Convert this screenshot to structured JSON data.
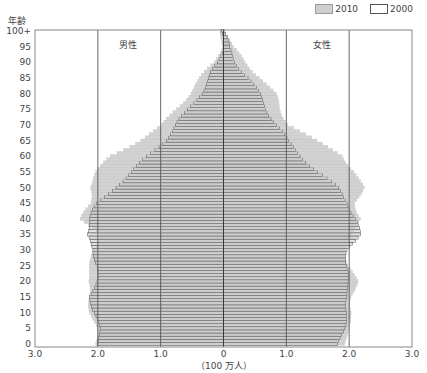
{
  "chart_data": {
    "type": "bar",
    "subtype": "population-pyramid",
    "title": "",
    "ylabel": "年齢",
    "xlabel": "（100 万人）",
    "x_unit": "100 万人",
    "xlim": [
      -3.0,
      3.0
    ],
    "x_ticks": [
      "3.0",
      "2.0",
      "1.0",
      "0",
      "1.0",
      "2.0",
      "3.0"
    ],
    "y_ticks": [
      "0",
      "5",
      "10",
      "15",
      "20",
      "25",
      "30",
      "35",
      "40",
      "45",
      "50",
      "55",
      "60",
      "65",
      "70",
      "75",
      "80",
      "85",
      "90",
      "95",
      "100+"
    ],
    "ylim": [
      0,
      100
    ],
    "grid": "vertical lines at ±1.0 and ±2.0 and 0",
    "legend": [
      {
        "label": "2010",
        "fill": "#cfcfcf",
        "stroke": "#9a9a9a"
      },
      {
        "label": "2000",
        "fill": "#ffffff",
        "stroke": "#555555"
      }
    ],
    "legend_position": "top-right",
    "annotations": {
      "male_label": "男性",
      "female_label": "女性"
    },
    "age_groups_step": 5,
    "ages": [
      0,
      5,
      10,
      15,
      20,
      25,
      30,
      35,
      40,
      45,
      50,
      55,
      60,
      65,
      70,
      75,
      80,
      85,
      90,
      95,
      100
    ],
    "series": [
      {
        "name": "2010 男性",
        "values": [
          2.02,
          2.05,
          2.1,
          2.12,
          2.18,
          2.1,
          2.05,
          2.0,
          2.25,
          2.1,
          2.15,
          2.0,
          1.8,
          1.35,
          0.95,
          0.75,
          0.55,
          0.35,
          0.15,
          0.05,
          0.02
        ]
      },
      {
        "name": "2010 女性",
        "values": [
          1.95,
          1.95,
          2.05,
          2.05,
          2.1,
          2.0,
          1.95,
          2.0,
          2.2,
          2.1,
          2.2,
          2.1,
          1.9,
          1.45,
          1.05,
          0.9,
          0.8,
          0.6,
          0.35,
          0.12,
          0.04
        ]
      },
      {
        "name": "2000 男性",
        "values": [
          1.97,
          2.0,
          2.05,
          2.1,
          2.05,
          2.0,
          2.05,
          2.2,
          2.12,
          2.0,
          1.75,
          1.45,
          1.2,
          0.95,
          0.75,
          0.55,
          0.38,
          0.22,
          0.08,
          0.02,
          0.01
        ]
      },
      {
        "name": "2000 女性",
        "values": [
          1.85,
          1.9,
          1.95,
          2.0,
          1.95,
          1.95,
          2.0,
          2.15,
          2.1,
          2.0,
          1.8,
          1.5,
          1.25,
          1.0,
          0.85,
          0.7,
          0.55,
          0.4,
          0.2,
          0.06,
          0.02
        ]
      }
    ]
  },
  "labels": {
    "y_title": "年齢",
    "x_unit": "（100 万人）",
    "male": "男性",
    "female": "女性",
    "legend_2010": "2010",
    "legend_2000": "2000"
  }
}
